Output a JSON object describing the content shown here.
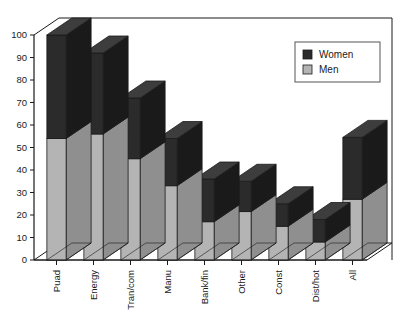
{
  "chart_data": {
    "type": "bar",
    "subtype": "stacked-3d-column",
    "title": "",
    "subtitle": "",
    "xlabel": "",
    "ylabel": "",
    "categories": [
      "Puad",
      "Energy",
      "Tran/com",
      "Manu",
      "Bank/fin",
      "Other",
      "Const",
      "Dist/hot",
      "All"
    ],
    "series": [
      {
        "name": "Men",
        "color": "#b4b4b4",
        "values": [
          54,
          56,
          45,
          33,
          17,
          21.5,
          15,
          8,
          27
        ]
      },
      {
        "name": "Women",
        "color": "#2b2b2b",
        "values": [
          46,
          36,
          27,
          21,
          19,
          13.5,
          10,
          10,
          27.5
        ]
      }
    ],
    "totals": [
      100,
      92,
      72,
      54,
      36,
      35,
      25,
      18,
      54.5
    ],
    "ylim": [
      0,
      100
    ],
    "ytick_step": 10,
    "yticks": [
      0,
      10,
      20,
      30,
      40,
      50,
      60,
      70,
      80,
      90,
      100
    ],
    "ytick_labels": [
      "0",
      "10",
      "20",
      "30",
      "40",
      "50",
      "60",
      "70",
      "80",
      "90",
      "100"
    ],
    "grid": false,
    "legend_position": "top-right",
    "stack_order_bottom_to_top": [
      "Men",
      "Women"
    ]
  },
  "legend": {
    "entries": [
      {
        "label": "Women",
        "swatch_color": "#2b2b2b"
      },
      {
        "label": "Men",
        "swatch_color": "#b4b4b4"
      }
    ]
  },
  "colors": {
    "women": "#2b2b2b",
    "women_side": "#1a1a1a",
    "women_top": "#3d3d3d",
    "men": "#b4b4b4",
    "men_side": "#8f8f8f",
    "men_top": "#c9c9c9",
    "axis": "#1a1a1a",
    "background": "#ffffff",
    "floor": "#ffffff"
  },
  "axes": {
    "y_axis_name": "y-axis",
    "x_axis_name": "x-axis"
  }
}
